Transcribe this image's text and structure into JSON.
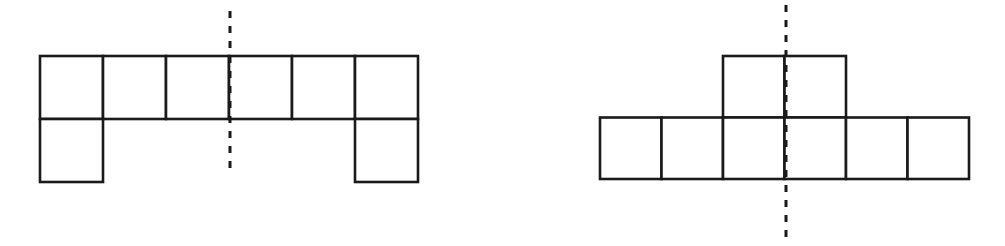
{
  "page": {
    "background_color": "#ffffff",
    "line_color": "#1a1a1a",
    "width": 1005,
    "height": 246
  },
  "figures": [
    {
      "id": "figure-left",
      "name": "left-polyomino-figure",
      "description": "Polyomino of 8 unit squares: a row of 6 squares on top with one square below the leftmost column and one square below the rightmost column, forming a U-like shape.",
      "cell_size": 63,
      "origin": {
        "x": 40,
        "y": 56
      },
      "rows": 2,
      "columns": 6,
      "cell_count": 8,
      "cells": [
        {
          "row": 0,
          "col": 0
        },
        {
          "row": 0,
          "col": 1
        },
        {
          "row": 0,
          "col": 2
        },
        {
          "row": 0,
          "col": 3
        },
        {
          "row": 0,
          "col": 4
        },
        {
          "row": 0,
          "col": 5
        },
        {
          "row": 1,
          "col": 0
        },
        {
          "row": 1,
          "col": 5
        }
      ],
      "symmetry_line": {
        "name": "vertical-line-of-symmetry",
        "orientation": "vertical",
        "x": 230,
        "y_start": 11,
        "y_end": 173,
        "style": "dashed"
      }
    },
    {
      "id": "figure-right",
      "name": "right-polyomino-figure",
      "description": "Polyomino of 8 unit squares: a row of 6 squares on the bottom with two squares stacked above the two centre columns, forming a T-like shape.",
      "cell_size": 61.5,
      "origin": {
        "x": 600,
        "y": 56
      },
      "rows": 2,
      "columns": 6,
      "cell_count": 8,
      "cells": [
        {
          "row": 0,
          "col": 2
        },
        {
          "row": 0,
          "col": 3
        },
        {
          "row": 1,
          "col": 0
        },
        {
          "row": 1,
          "col": 1
        },
        {
          "row": 1,
          "col": 2
        },
        {
          "row": 1,
          "col": 3
        },
        {
          "row": 1,
          "col": 4
        },
        {
          "row": 1,
          "col": 5
        }
      ],
      "symmetry_line": {
        "name": "vertical-line-of-symmetry",
        "orientation": "vertical",
        "x": 786,
        "y_start": 5,
        "y_end": 239,
        "style": "dashed"
      }
    }
  ]
}
